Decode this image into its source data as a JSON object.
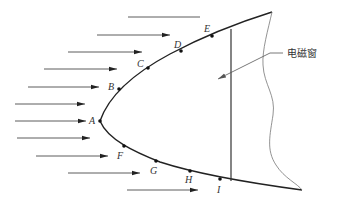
{
  "diagram": {
    "window_label": "电磁窗",
    "points": [
      {
        "label": "A",
        "x": 100,
        "y": 121,
        "lx": 89,
        "ly": 124
      },
      {
        "label": "B",
        "x": 119,
        "y": 89,
        "lx": 108,
        "ly": 90
      },
      {
        "label": "C",
        "x": 148,
        "y": 68,
        "lx": 137,
        "ly": 67
      },
      {
        "label": "D",
        "x": 181,
        "y": 51,
        "lx": 174,
        "ly": 48
      },
      {
        "label": "E",
        "x": 212,
        "y": 36,
        "lx": 204,
        "ly": 32
      },
      {
        "label": "F",
        "x": 124,
        "y": 146,
        "lx": 117,
        "ly": 159
      },
      {
        "label": "G",
        "x": 156,
        "y": 161,
        "lx": 150,
        "ly": 174
      },
      {
        "label": "H",
        "x": 190,
        "y": 171,
        "lx": 185,
        "ly": 183
      },
      {
        "label": "I",
        "x": 220,
        "y": 179,
        "lx": 217,
        "ly": 193
      }
    ],
    "arrows": [
      {
        "x1": 128,
        "x2": 200,
        "y": 17,
        "head": false
      },
      {
        "x1": 97,
        "x2": 170,
        "y": 35,
        "head": true
      },
      {
        "x1": 68,
        "x2": 142,
        "y": 52,
        "head": true
      },
      {
        "x1": 44,
        "x2": 117,
        "y": 69,
        "head": true
      },
      {
        "x1": 28,
        "x2": 99,
        "y": 87,
        "head": true
      },
      {
        "x1": 15,
        "x2": 85,
        "y": 104,
        "head": true
      },
      {
        "x1": 15,
        "x2": 86,
        "y": 121,
        "head": true
      },
      {
        "x1": 17,
        "x2": 90,
        "y": 138,
        "head": true
      },
      {
        "x1": 36,
        "x2": 108,
        "y": 156,
        "head": true
      },
      {
        "x1": 68,
        "x2": 140,
        "y": 173,
        "head": true
      },
      {
        "x1": 127,
        "x2": 198,
        "y": 190,
        "head": true
      }
    ]
  }
}
